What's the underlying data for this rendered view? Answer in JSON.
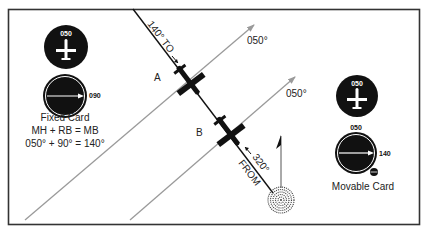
{
  "figure": {
    "type": "ADF orientation diagram",
    "colors": {
      "frame": "#333333",
      "course_line": "#111111",
      "heading_lines": "#9a9a9a",
      "instrument_face": "#111111",
      "instrument_marking": "#ffffff"
    }
  },
  "bearing_line": {
    "to_label": "140° TO",
    "from_label_value": "320°",
    "from_label_word": "FROM"
  },
  "heading_lines": [
    {
      "label": "050°"
    },
    {
      "label": "050°"
    }
  ],
  "aircraft": [
    {
      "label": "A"
    },
    {
      "label": "B"
    }
  ],
  "fixed_card": {
    "heading_indicator_value": "050",
    "adf_needle_value": "090",
    "caption": "Fixed Card",
    "formula": "MH + RB = MB",
    "calculation": "050° + 90° = 140°"
  },
  "movable_card": {
    "heading_indicator_value": "050",
    "card_top_value": "050",
    "adf_needle_value": "140",
    "caption": "Movable Card"
  },
  "station": {
    "icon": "ndb-station-icon"
  },
  "north_arrow": {
    "icon": "north-arrow-icon"
  }
}
